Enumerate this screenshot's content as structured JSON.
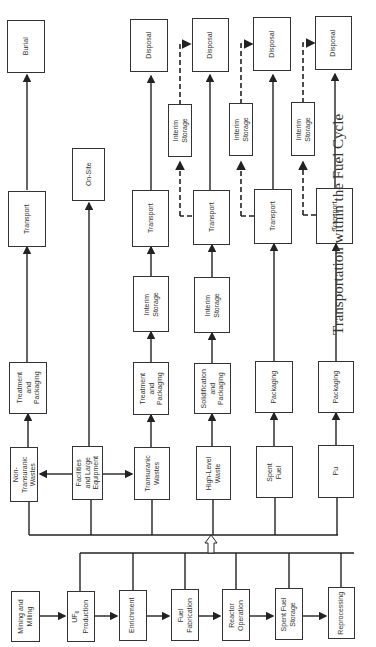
{
  "caption": "Transportation within the Fuel Cycle",
  "fuel_cycle": [
    {
      "id": "mining",
      "label": "Mining and\nMilling"
    },
    {
      "id": "uf6",
      "label": "UF6\nProduction"
    },
    {
      "id": "enrichment",
      "label": "Enrichment"
    },
    {
      "id": "fuel-fab",
      "label": "Fuel\nFabrication"
    },
    {
      "id": "reactor",
      "label": "Reactor\nOperation"
    },
    {
      "id": "spent-storage",
      "label": "Spent Fuel\nStorage"
    },
    {
      "id": "reprocessing",
      "label": "Reprocessing"
    }
  ],
  "materials": [
    {
      "id": "non-tru",
      "label": "Non-\nTransuranic\nWastes"
    },
    {
      "id": "facilities",
      "label": "Facilities\nand Large\nEquipment"
    },
    {
      "id": "tru",
      "label": "Transuranic\nWastes"
    },
    {
      "id": "hlw",
      "label": "High-Level\nWaste"
    },
    {
      "id": "spent-fuel",
      "label": "Spent\nFuel"
    },
    {
      "id": "pu",
      "label": "Pu"
    }
  ],
  "steps": {
    "treat_pack_1": "Treatment\nand\nPackaging",
    "treat_pack_2": "Treatment\nand\nPackaging",
    "solid_pack": "Solidification\nand\nPackaging",
    "packaging_1": "Packaging",
    "packaging_2": "Packaging",
    "interim_1": "Interim\nStorage",
    "interim_2": "Interim\nStorage",
    "interim_3": "Interim\nStorage",
    "interim_4": "Interim\nStorage",
    "interim_5": "Interim\nStorage",
    "transport": "Transport",
    "burial": "Burial",
    "on_site": "On-Site",
    "disposal": "Disposal"
  }
}
